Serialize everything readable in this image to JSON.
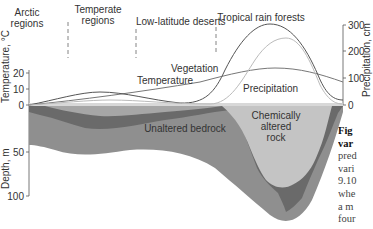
{
  "regions": [
    {
      "label_line1": "Arctic",
      "label_line2": "regions"
    },
    {
      "label_line1": "Temperate",
      "label_line2": "regions"
    },
    {
      "label_line1": "Low-latitude deserts",
      "label_line2": ""
    },
    {
      "label_line1": "Tropical rain forests",
      "label_line2": ""
    }
  ],
  "axes": {
    "left_top_label": "Temperature, °C",
    "left_top_ticks": [
      "20",
      "10",
      "0"
    ],
    "left_bottom_label": "Depth, m",
    "left_bottom_ticks": [
      "50",
      "100"
    ],
    "right_label": "Precipitation, cm",
    "right_ticks": [
      "300",
      "200",
      "100",
      "0"
    ]
  },
  "curves": {
    "vegetation": "Vegetation",
    "temperature": "Temperature",
    "precipitation": "Precipitation"
  },
  "zones": {
    "unaltered": "Unaltered bedrock",
    "altered_line1": "Chemically",
    "altered_line2": "altered",
    "altered_line3": "rock"
  },
  "caption": {
    "bold_line1": "Fig",
    "bold_line2": "var",
    "lines": [
      "pred",
      "vari",
      "9.10",
      "whe",
      "a m",
      "four",
      "are"
    ]
  },
  "colors": {
    "bedrock": "#8f8f8f",
    "weathered_band": "#6a6a6a",
    "altered_rock": "#c4c4c4",
    "vegetation_curve": "#555555",
    "temperature_curve": "#777777",
    "precipitation_curve": "#bbbbbb"
  }
}
